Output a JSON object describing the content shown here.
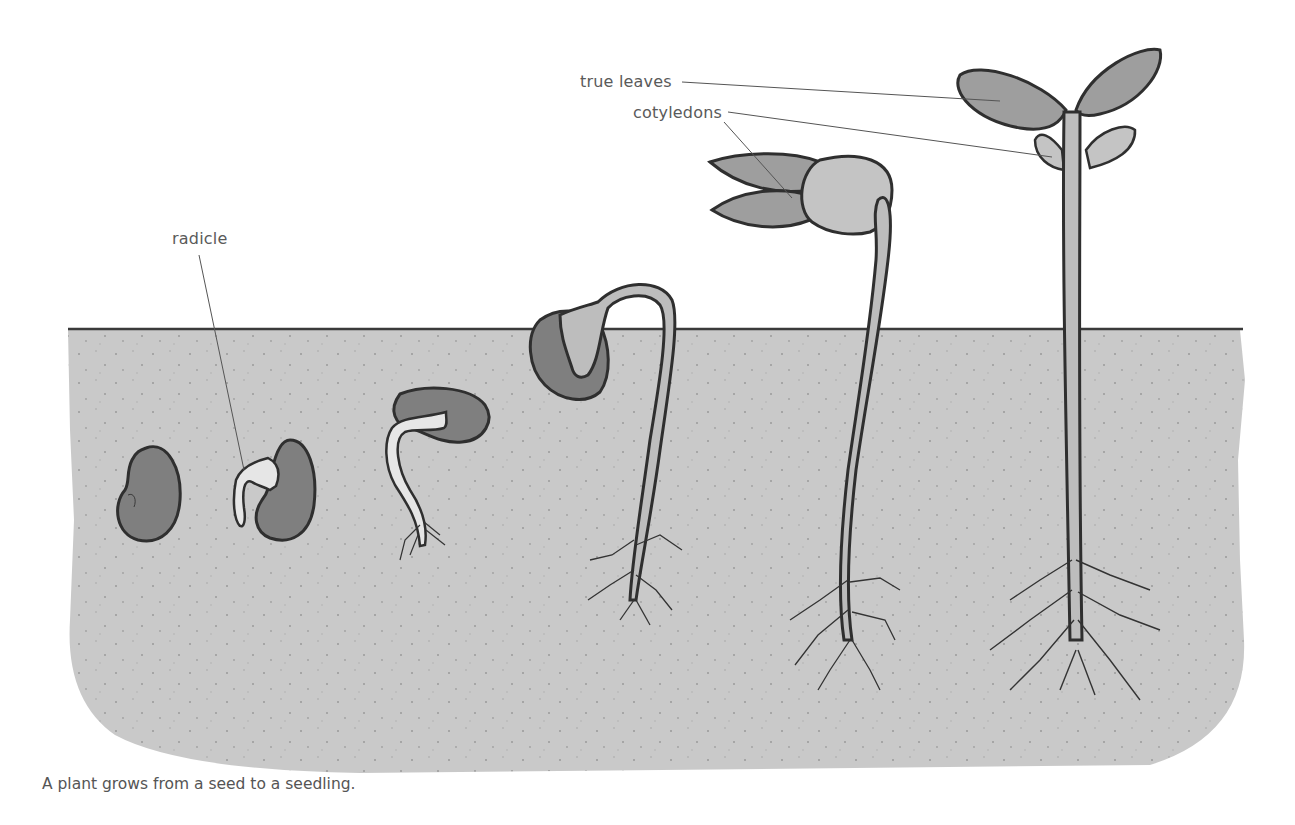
{
  "diagram": {
    "caption": "A plant grows from a seed to a seedling.",
    "labels": {
      "radicle": "radicle",
      "cotyledons": "cotyledons",
      "true_leaves": "true leaves"
    },
    "stages": [
      {
        "id": 1,
        "name": "seed"
      },
      {
        "id": 2,
        "name": "seed with emerging radicle"
      },
      {
        "id": 3,
        "name": "germinating seed with root"
      },
      {
        "id": 4,
        "name": "hypocotyl hook emerging"
      },
      {
        "id": 5,
        "name": "seedling with cotyledons"
      },
      {
        "id": 6,
        "name": "seedling with true leaves"
      }
    ],
    "colors": {
      "soil": "#c8c8c8",
      "soil_line": "#3a3a3a",
      "seed": "#7f7f7f",
      "seed_outline": "#2f2f2f",
      "stem": "#bdbdbd",
      "radicle": "#e6e6e6",
      "leaf": "#9e9e9e",
      "cotyledon": "#c4c4c4",
      "text": "#5a5a5a"
    }
  }
}
